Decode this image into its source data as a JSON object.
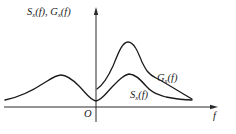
{
  "figure": {
    "y_axis_label": "Sₓ(f), Gₓ(f)",
    "y_axis_label_parts": {
      "s": "S",
      "s_sub": "x",
      "s_arg": "(f)",
      "sep": ", ",
      "g": "G",
      "g_sub": "x",
      "g_arg": "(f)"
    },
    "x_axis_label": "f",
    "origin_label": "O",
    "curves": [
      {
        "name": "Gx(f)",
        "label": "G",
        "sub": "x",
        "arg": "(f)",
        "description": "one-sided power spectral density, zero for f<0, peak at positive f"
      },
      {
        "name": "Sx(f)",
        "label": "S",
        "sub": "x",
        "arg": "(f)",
        "description": "two-sided power spectral density, symmetric about f=0"
      }
    ],
    "colors": {
      "line": "#1a1a1a",
      "background": "#ffffff"
    }
  }
}
